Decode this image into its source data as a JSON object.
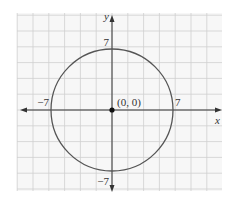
{
  "chart_data": {
    "type": "line",
    "title": "",
    "xlabel": "x",
    "ylabel": "y",
    "xlim": [
      -13,
      13
    ],
    "ylim": [
      -9.5,
      12.6
    ],
    "grid": true,
    "grid_step_units": 2,
    "equation": "x^2 + y^2 = 49",
    "center": {
      "x": 0,
      "y": 0,
      "label": "(0, 0)"
    },
    "radius": 7,
    "intercepts": [
      {
        "x": -7,
        "y": 0,
        "label": "−7"
      },
      {
        "x": 7,
        "y": 0,
        "label": "7"
      },
      {
        "x": 0,
        "y": 7,
        "label": "7"
      },
      {
        "x": 0,
        "y": -7,
        "label": "−7"
      }
    ],
    "colors": {
      "circle": "#555555",
      "axis": "#333333",
      "grid": "#cfcfcf",
      "plot_background": "#f7f7f7",
      "point": "#111111"
    }
  }
}
